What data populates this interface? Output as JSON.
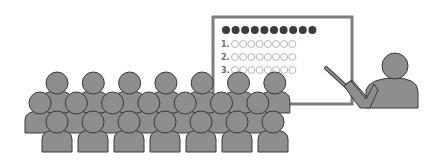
{
  "scene": {
    "description": "Classroom presentation illustration: teacher pointing at a whiteboard in front of an audience",
    "colors": {
      "figure_fill": "#8e8e8e",
      "figure_stroke": "#3a3a3a",
      "board_frame": "#7d7d7d",
      "filled_dot": "#3c3c3c",
      "hollow_dot": "#b5b5b5",
      "label": "#6f6f6f"
    }
  },
  "board": {
    "header_dots": 10,
    "rows": [
      {
        "label": "1.",
        "circles": 8
      },
      {
        "label": "2.",
        "circles": 8
      },
      {
        "label": "3.",
        "circles": 8
      }
    ]
  },
  "audience": {
    "rows": [
      {
        "name": "back",
        "count": 7
      },
      {
        "name": "middle",
        "count": 7
      },
      {
        "name": "front",
        "count": 7
      }
    ]
  },
  "teacher": {
    "has_pointer": true
  }
}
